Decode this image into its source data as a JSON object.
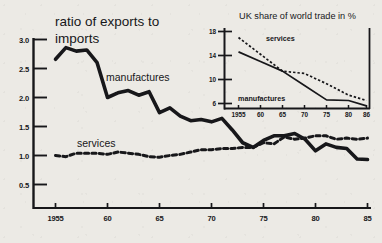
{
  "figure": {
    "background_color": "#eceae5",
    "ink_color": "#17171a"
  },
  "main": {
    "title_line1": "ratio of exports to",
    "title_line2": "imports",
    "series_label_manufactures": "manufactures",
    "series_label_services": "services",
    "y_ticks": [
      "3.0",
      "2.5",
      "2.0",
      "1.5",
      "1.0",
      "0.5"
    ],
    "x_ticks": [
      "1955",
      "60",
      "65",
      "70",
      "75",
      "80",
      "85"
    ]
  },
  "inset": {
    "title": "UK share of world trade in %",
    "series_label_manufactures": "manufactures",
    "series_label_services": "services",
    "y_ticks": [
      "18",
      "14",
      "10",
      "6"
    ],
    "x_ticks": [
      "1955",
      "60",
      "65",
      "70",
      "75",
      "80",
      "86"
    ]
  },
  "chart_data": [
    {
      "id": "main",
      "type": "line",
      "title": "ratio of exports to imports",
      "xlabel": "",
      "ylabel": "ratio of exports to imports",
      "xlim": [
        1954,
        1986
      ],
      "ylim": [
        0.35,
        3.15
      ],
      "y_ticks": [
        3.0,
        2.5,
        2.0,
        1.5,
        1.0,
        0.5
      ],
      "x_ticks": [
        1955,
        1960,
        1965,
        1970,
        1975,
        1980,
        1985
      ],
      "grid": false,
      "legend": "inline-annotations",
      "x": [
        1955,
        1956,
        1957,
        1958,
        1959,
        1960,
        1961,
        1962,
        1963,
        1964,
        1965,
        1966,
        1967,
        1968,
        1969,
        1970,
        1971,
        1972,
        1973,
        1974,
        1975,
        1976,
        1977,
        1978,
        1979,
        1980,
        1981,
        1982,
        1983,
        1984,
        1985
      ],
      "series": [
        {
          "name": "manufactures",
          "style": "solid-thick",
          "values": [
            2.66,
            2.86,
            2.8,
            2.82,
            2.6,
            2.0,
            2.08,
            2.12,
            2.04,
            2.1,
            1.74,
            1.82,
            1.68,
            1.6,
            1.62,
            1.58,
            1.64,
            1.44,
            1.22,
            1.14,
            1.26,
            1.34,
            1.34,
            1.38,
            1.28,
            1.08,
            1.2,
            1.14,
            1.12,
            0.94,
            0.93
          ]
        },
        {
          "name": "services",
          "style": "dashed",
          "values": [
            1.0,
            0.98,
            1.04,
            1.04,
            1.04,
            1.02,
            1.06,
            1.04,
            1.02,
            0.98,
            0.97,
            1.0,
            1.02,
            1.06,
            1.1,
            1.1,
            1.12,
            1.12,
            1.14,
            1.14,
            1.22,
            1.2,
            1.32,
            1.28,
            1.3,
            1.34,
            1.34,
            1.28,
            1.3,
            1.28,
            1.3
          ]
        }
      ]
    },
    {
      "id": "inset",
      "type": "line",
      "title": "UK share of world trade in %",
      "xlabel": "",
      "ylabel": "%",
      "xlim": [
        1954,
        1987
      ],
      "ylim": [
        4.0,
        19.0
      ],
      "y_ticks": [
        18,
        14,
        10,
        6
      ],
      "x_ticks": [
        1955,
        1960,
        1965,
        1970,
        1975,
        1980,
        1986
      ],
      "grid": false,
      "legend": "inline-annotations",
      "x": [
        1955,
        1960,
        1965,
        1970,
        1975,
        1980,
        1986
      ],
      "series": [
        {
          "name": "services",
          "style": "dashed",
          "values": [
            17.0,
            14.2,
            11.4,
            11.0,
            9.3,
            7.4,
            6.5
          ]
        },
        {
          "name": "manufactures",
          "style": "solid",
          "values": [
            14.6,
            13.0,
            11.4,
            9.0,
            6.6,
            6.5,
            5.6
          ]
        }
      ]
    }
  ]
}
